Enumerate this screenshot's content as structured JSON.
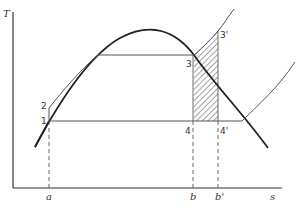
{
  "diagram": {
    "type": "T-s diagram (Rankine cycle with superheat comparison)",
    "axes": {
      "y_label": "T",
      "x_label": "s"
    },
    "state_points": {
      "p1": "1",
      "p2": "2",
      "p3": "3",
      "p3p": "3'",
      "p4": "4",
      "p4p": "4'"
    },
    "x_ticks": {
      "a": "a",
      "b": "b",
      "bp": "b'"
    },
    "colors": {
      "line": "#222222",
      "thin_line": "#555555",
      "hatch": "#444444",
      "background": "#ffffff"
    }
  }
}
